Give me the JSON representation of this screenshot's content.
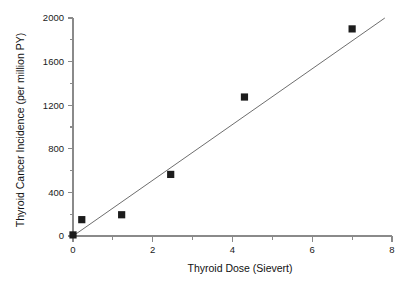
{
  "chart_data": {
    "type": "scatter",
    "title": "",
    "xlabel": "Thyroid Dose (Sievert)",
    "ylabel": "Thyroid Cancer Incidence (per million PY)",
    "xlim": [
      0,
      8
    ],
    "ylim": [
      0,
      2000
    ],
    "grid": false,
    "legend": null,
    "x_major_ticks": [
      0,
      2,
      4,
      6,
      8
    ],
    "x_major_tick_labels": [
      "0",
      "2",
      "4",
      "6",
      "8"
    ],
    "x_minor_ticks": [
      1,
      3,
      5,
      7
    ],
    "y_major_ticks": [
      0,
      400,
      800,
      1200,
      1600,
      2000
    ],
    "y_major_tick_labels": [
      "0",
      "400",
      "800",
      "1200",
      "1600",
      "2000"
    ],
    "y_minor_ticks": [
      200,
      600,
      1000,
      1400,
      1800
    ],
    "marker": "filled-square",
    "marker_color": "#1c1c1c",
    "points": [
      {
        "x": 0.0,
        "y": 10
      },
      {
        "x": 0.22,
        "y": 150
      },
      {
        "x": 1.22,
        "y": 195
      },
      {
        "x": 2.45,
        "y": 565
      },
      {
        "x": 4.3,
        "y": 1275
      },
      {
        "x": 7.0,
        "y": 1900
      }
    ],
    "series": [
      {
        "name": "Thyroid cancer incidence",
        "x": [
          0.0,
          0.22,
          1.22,
          2.45,
          4.3,
          7.0
        ],
        "values": [
          10,
          150,
          195,
          565,
          1275,
          1900
        ]
      }
    ],
    "fit_line": {
      "type": "line",
      "color": "#6e6e6e",
      "x": [
        0.0,
        7.82
      ],
      "y": [
        0,
        2000
      ]
    }
  }
}
